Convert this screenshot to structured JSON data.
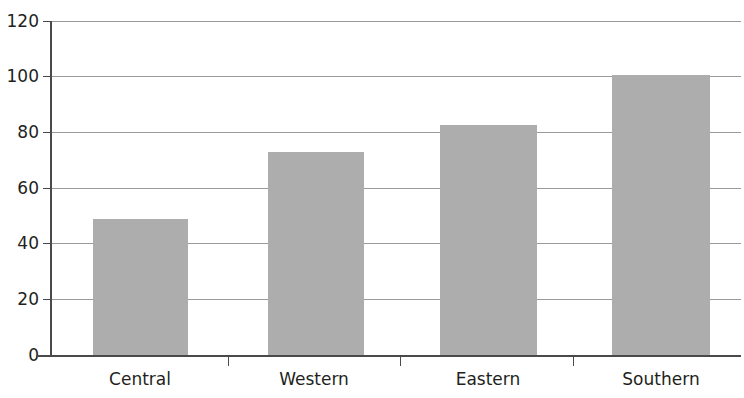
{
  "chart_data": {
    "type": "bar",
    "title": "",
    "subtitle": "",
    "xlabel": "",
    "ylabel": "",
    "categories": [
      "Central",
      "Western",
      "Eastern",
      "Southern"
    ],
    "values": [
      49,
      73,
      82.5,
      100.5
    ],
    "series": [
      {
        "name": "",
        "values": [
          49,
          73,
          82.5,
          100.5
        ]
      }
    ],
    "ylim": [
      0,
      120
    ],
    "yticks": [
      0,
      20,
      40,
      60,
      80,
      100,
      120
    ],
    "ytick_labels": [
      "0",
      "20",
      "40",
      "60",
      "80",
      "100",
      "120"
    ],
    "grid": true,
    "grid_axis": "y",
    "legend": false,
    "legend_position": "none",
    "bar_color": "#adadad",
    "gridline_color": "#9a9a9a",
    "axis_color": "#4a4a4a",
    "text_color": "#231f20",
    "background_color": "#ffffff",
    "annotations": []
  }
}
